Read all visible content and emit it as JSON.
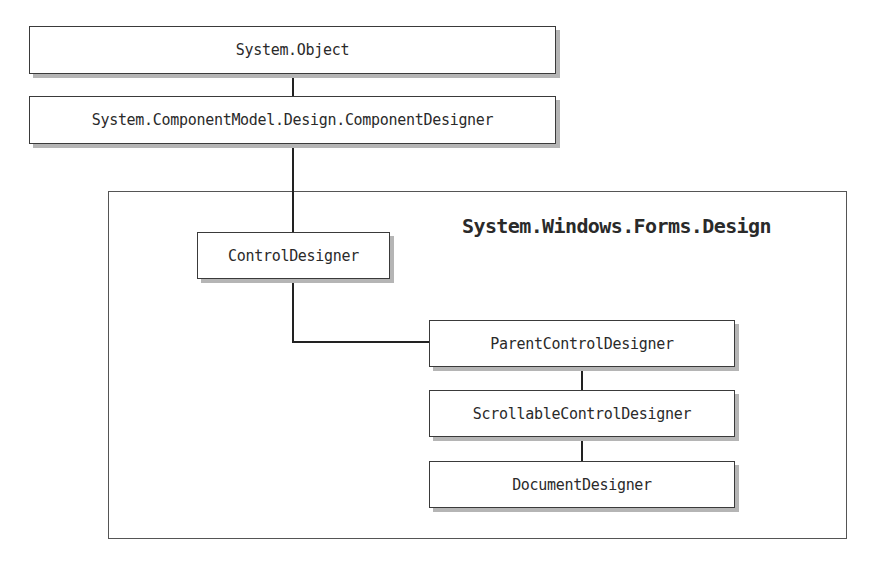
{
  "diagram": {
    "type": "class-hierarchy",
    "nodes": [
      {
        "id": "system-object",
        "label": "System.Object"
      },
      {
        "id": "component-designer",
        "label": "System.ComponentModel.Design.ComponentDesigner"
      },
      {
        "id": "control-designer",
        "label": "ControlDesigner"
      },
      {
        "id": "parent-control-designer",
        "label": "ParentControlDesigner"
      },
      {
        "id": "scrollable-control-designer",
        "label": "ScrollableControlDesigner"
      },
      {
        "id": "document-designer",
        "label": "DocumentDesigner"
      }
    ],
    "edges": [
      {
        "from": "system-object",
        "to": "component-designer"
      },
      {
        "from": "component-designer",
        "to": "control-designer"
      },
      {
        "from": "control-designer",
        "to": "parent-control-designer"
      },
      {
        "from": "parent-control-designer",
        "to": "scrollable-control-designer"
      },
      {
        "from": "scrollable-control-designer",
        "to": "document-designer"
      }
    ],
    "namespace_group": {
      "label": "System.Windows.Forms.Design",
      "members": [
        "control-designer",
        "parent-control-designer",
        "scrollable-control-designer",
        "document-designer"
      ]
    }
  }
}
